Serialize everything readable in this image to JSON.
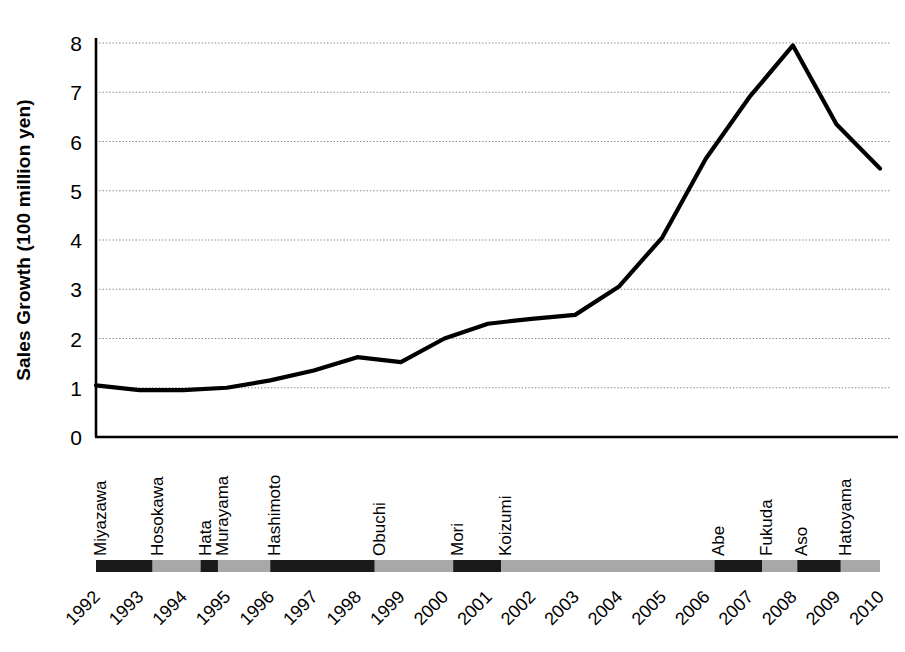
{
  "chart_data": {
    "type": "line",
    "title": "",
    "subtitle": "",
    "xlabel": "",
    "ylabel": "Sales Growth (100 million yen)",
    "ylim": [
      0,
      8.15
    ],
    "yticks": [
      0,
      1,
      2,
      3,
      4,
      5,
      6,
      7,
      8
    ],
    "ytick_labels": [
      "0",
      "1",
      "2",
      "3",
      "4",
      "5",
      "6",
      "7",
      "8"
    ],
    "grid": "horizontal-dotted",
    "legend": "none",
    "x": [
      1992,
      1993,
      1994,
      1995,
      1996,
      1997,
      1998,
      1999,
      2000,
      2001,
      2002,
      2003,
      2004,
      2005,
      2006,
      2007,
      2008,
      2009,
      2010
    ],
    "xtick_labels": [
      "1992",
      "1993",
      "1994",
      "1995",
      "1996",
      "1997",
      "1998",
      "1999",
      "2000",
      "2001",
      "2002",
      "2003",
      "2004",
      "2005",
      "2006",
      "2007",
      "2008",
      "2009",
      "2010"
    ],
    "categories": [
      "1992",
      "1993",
      "1994",
      "1995",
      "1996",
      "1997",
      "1998",
      "1999",
      "2000",
      "2001",
      "2002",
      "2003",
      "2004",
      "2005",
      "2006",
      "2007",
      "2008",
      "2009",
      "2010"
    ],
    "values": [
      1.05,
      0.95,
      0.95,
      1.0,
      1.15,
      1.35,
      1.62,
      1.52,
      2.0,
      2.3,
      2.4,
      2.48,
      3.05,
      4.05,
      5.65,
      6.9,
      7.95,
      6.35,
      5.45
    ],
    "series": [
      {
        "name": "Sales Growth",
        "color": "#000000",
        "values": [
          1.05,
          0.95,
          0.95,
          1.0,
          1.15,
          1.35,
          1.62,
          1.52,
          2.0,
          2.3,
          2.4,
          2.48,
          3.05,
          4.05,
          5.65,
          6.9,
          7.95,
          6.35,
          5.45
        ]
      }
    ],
    "annotations": {
      "prime_ministers": [
        {
          "name": "Miyazawa",
          "start": 1992.0,
          "end": 1993.3,
          "shade": "dark"
        },
        {
          "name": "Hosokawa",
          "start": 1993.3,
          "end": 1994.4,
          "shade": "light"
        },
        {
          "name": "Hata",
          "start": 1994.4,
          "end": 1994.8,
          "shade": "dark"
        },
        {
          "name": "Murayama",
          "start": 1994.8,
          "end": 1996.0,
          "shade": "light"
        },
        {
          "name": "Hashimoto",
          "start": 1996.0,
          "end": 1998.4,
          "shade": "dark"
        },
        {
          "name": "Obuchi",
          "start": 1998.4,
          "end": 2000.2,
          "shade": "light"
        },
        {
          "name": "Mori",
          "start": 2000.2,
          "end": 2001.3,
          "shade": "dark"
        },
        {
          "name": "Koizumi",
          "start": 2001.3,
          "end": 2006.2,
          "shade": "light"
        },
        {
          "name": "Abe",
          "start": 2006.2,
          "end": 2007.3,
          "shade": "dark"
        },
        {
          "name": "Fukuda",
          "start": 2007.3,
          "end": 2008.1,
          "shade": "light"
        },
        {
          "name": "Aso",
          "start": 2008.1,
          "end": 2009.1,
          "shade": "dark"
        },
        {
          "name": "Hatoyama",
          "start": 2009.1,
          "end": 2010.0,
          "shade": "light"
        }
      ]
    },
    "colors": {
      "line": "#000000",
      "axis": "#000000",
      "grid": "#888888",
      "band_dark": "#1a1a1a",
      "band_light": "#a8a8a8",
      "background": "#ffffff"
    }
  }
}
